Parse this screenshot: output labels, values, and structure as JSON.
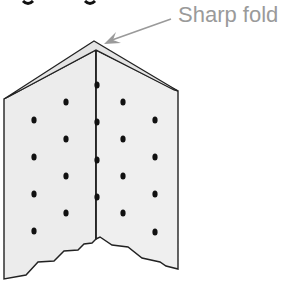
{
  "figure": {
    "annotation": {
      "label": "Sharp fold",
      "color": "#9a9a9a",
      "arrow_from": [
        171,
        19
      ],
      "arrow_to": [
        104,
        44
      ]
    },
    "cropped_heading_fragment": "g g",
    "paper": {
      "fill": "#ececec",
      "stroke": "#222222",
      "description": "folded sheet viewed as inverted V with torn bottom edge"
    },
    "dots": {
      "color": "#111111",
      "positions": [
        [
          34,
          120
        ],
        [
          34,
          157
        ],
        [
          34,
          194
        ],
        [
          34,
          231
        ],
        [
          66,
          102
        ],
        [
          66,
          139
        ],
        [
          66,
          176
        ],
        [
          66,
          213
        ],
        [
          97,
          85
        ],
        [
          97,
          122
        ],
        [
          97,
          160
        ],
        [
          97,
          197
        ],
        [
          123,
          102
        ],
        [
          123,
          139
        ],
        [
          123,
          176
        ],
        [
          123,
          213
        ],
        [
          155,
          120
        ],
        [
          155,
          157
        ],
        [
          155,
          194
        ],
        [
          155,
          232
        ]
      ]
    }
  }
}
